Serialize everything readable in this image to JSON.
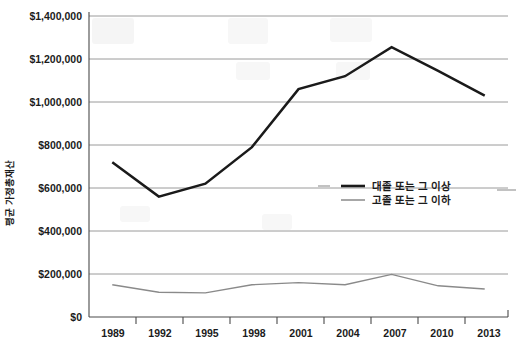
{
  "chart_data": {
    "type": "line",
    "title": "",
    "xlabel": "",
    "ylabel": "평균 가정총재산",
    "categories": [
      "1989",
      "1992",
      "1995",
      "1998",
      "2001",
      "2004",
      "2007",
      "2010",
      "2013"
    ],
    "ylim": [
      0,
      1400000
    ],
    "ytick_values": [
      0,
      200000,
      400000,
      600000,
      800000,
      1000000,
      1200000,
      1400000
    ],
    "ytick_labels": [
      "$0",
      "$200,000",
      "$400,000",
      "$600,000",
      "$800,000",
      "$1,000,000",
      "$1,200,000",
      "$1,400,000"
    ],
    "grid": true,
    "legend_position": "inside-right-middle",
    "series": [
      {
        "name": "대졸 또는 그 이상",
        "color": "#1a1a1a",
        "style": "thick-solid",
        "values": [
          720000,
          560000,
          620000,
          790000,
          1060000,
          1120000,
          1255000,
          1145000,
          1030000
        ]
      },
      {
        "name": "고졸 또는 그 이하",
        "color": "#8a8a8a",
        "style": "thin-solid",
        "values": [
          150000,
          115000,
          112000,
          150000,
          160000,
          150000,
          198000,
          145000,
          130000
        ]
      }
    ]
  },
  "axis": {
    "y_title": "평균 가정총재산",
    "y_labels": [
      "$1,400,000",
      "$1,200,000",
      "$1,000,000",
      "$800,000",
      "$600,000",
      "$400,000",
      "$200,000",
      "$0"
    ],
    "x_labels": [
      "1989",
      "1992",
      "1995",
      "1998",
      "2001",
      "2004",
      "2007",
      "2010",
      "2013"
    ]
  },
  "legend": {
    "items": [
      {
        "label": "대졸 또는 그 이상",
        "color": "#1a1a1a"
      },
      {
        "label": "고졸 또는 그 이하",
        "color": "#8a8a8a"
      }
    ]
  },
  "colors": {
    "primary_series": "#1a1a1a",
    "secondary_series": "#8a8a8a",
    "gridline": "#8e8e8e",
    "axis": "#4a4a4a",
    "background": "#ffffff"
  }
}
